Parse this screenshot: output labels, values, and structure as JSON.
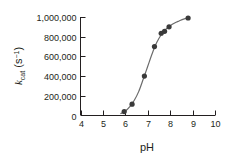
{
  "chart_data": {
    "type": "scatter",
    "title": "",
    "xlabel": "pH",
    "ylabel": "k_cat (s^-1)",
    "ylabel_parts": {
      "symbol": "k",
      "subscript": "cat",
      "unit_open": " (s",
      "unit_superscript": "−1",
      "unit_close": ")"
    },
    "xlim": [
      4,
      10
    ],
    "ylim": [
      0,
      1000000
    ],
    "xticks": [
      4,
      5,
      6,
      7,
      8,
      9,
      10
    ],
    "xtick_labels": [
      "4",
      "5",
      "6",
      "7",
      "8",
      "9",
      "10"
    ],
    "yticks": [
      0,
      200000,
      400000,
      600000,
      800000,
      1000000
    ],
    "ytick_labels": [
      "0",
      "200,000",
      "400,000",
      "600,000",
      "800,000",
      "1,000,000"
    ],
    "grid": false,
    "legend": null,
    "marker_color": "#3a3a3a",
    "line_color": "#6b6b6b",
    "axis_color": "#231f20",
    "background_color": "#ffffff",
    "points": [
      {
        "x": 5.95,
        "y": 40000
      },
      {
        "x": 6.3,
        "y": 115000
      },
      {
        "x": 6.85,
        "y": 400000
      },
      {
        "x": 7.3,
        "y": 700000
      },
      {
        "x": 7.6,
        "y": 835000
      },
      {
        "x": 7.75,
        "y": 855000
      },
      {
        "x": 7.95,
        "y": 900000
      },
      {
        "x": 8.8,
        "y": 990000
      }
    ],
    "curve": [
      {
        "x": 5.8,
        "y": 20000
      },
      {
        "x": 6.0,
        "y": 45000
      },
      {
        "x": 6.2,
        "y": 90000
      },
      {
        "x": 6.4,
        "y": 155000
      },
      {
        "x": 6.6,
        "y": 245000
      },
      {
        "x": 6.8,
        "y": 370000
      },
      {
        "x": 7.0,
        "y": 500000
      },
      {
        "x": 7.2,
        "y": 630000
      },
      {
        "x": 7.4,
        "y": 740000
      },
      {
        "x": 7.6,
        "y": 820000
      },
      {
        "x": 7.8,
        "y": 875000
      },
      {
        "x": 8.0,
        "y": 912000
      },
      {
        "x": 8.2,
        "y": 940000
      },
      {
        "x": 8.4,
        "y": 960000
      },
      {
        "x": 8.6,
        "y": 978000
      },
      {
        "x": 8.8,
        "y": 990000
      }
    ]
  }
}
